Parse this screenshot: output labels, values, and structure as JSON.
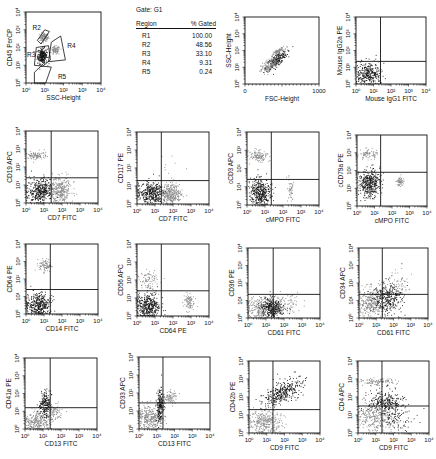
{
  "gate_table": {
    "title": "Gate: G1",
    "header": [
      "Region",
      "% Gated"
    ],
    "rows": [
      {
        "region": "R1",
        "pct": "100.00"
      },
      {
        "region": "R2",
        "pct": "48.56"
      },
      {
        "region": "R3",
        "pct": "33.10"
      },
      {
        "region": "R4",
        "pct": "9.31"
      },
      {
        "region": "R5",
        "pct": "0.24"
      }
    ]
  },
  "chart_data": [
    {
      "id": "p1",
      "type": "scatter",
      "title": "",
      "xlabel": "SSC-Height",
      "ylabel": "CD45 PerCP",
      "xscale": "log",
      "yscale": "log",
      "xlim": [
        0,
        4
      ],
      "ylim": [
        0,
        4
      ],
      "xticks": [
        "0",
        "1",
        "2",
        "3",
        "4"
      ],
      "yticks": [
        "0",
        "1",
        "2",
        "3",
        "4"
      ],
      "quadrant": null,
      "regions": [
        {
          "name": "R2",
          "label_at": [
            0.35,
            3.0
          ],
          "polygon": [
            [
              0.6,
              2.4
            ],
            [
              1.0,
              3.0
            ],
            [
              1.25,
              2.9
            ],
            [
              0.8,
              2.2
            ]
          ]
        },
        {
          "name": "R3",
          "label_at": [
            0.05,
            1.45
          ],
          "polygon": [
            [
              0.45,
              1.0
            ],
            [
              0.55,
              2.0
            ],
            [
              1.2,
              2.1
            ],
            [
              1.3,
              1.3
            ],
            [
              0.9,
              0.95
            ]
          ]
        },
        {
          "name": "R4",
          "label_at": [
            2.2,
            2.0
          ],
          "polygon": [
            [
              1.2,
              1.2
            ],
            [
              1.35,
              2.3
            ],
            [
              1.85,
              2.65
            ],
            [
              2.1,
              1.3
            ]
          ]
        },
        {
          "name": "R5",
          "label_at": [
            1.7,
            0.2
          ],
          "polygon": [
            [
              0.45,
              0.0
            ],
            [
              0.45,
              0.6
            ],
            [
              0.8,
              0.95
            ],
            [
              1.35,
              0.9
            ],
            [
              1.05,
              0.0
            ]
          ]
        }
      ],
      "populations": [
        {
          "cx": 0.95,
          "cy": 2.6,
          "sx": 0.12,
          "sy": 0.12,
          "n": 120,
          "shade": "gray"
        },
        {
          "cx": 0.85,
          "cy": 1.55,
          "sx": 0.13,
          "sy": 0.22,
          "n": 260,
          "shade": "black"
        },
        {
          "cx": 1.55,
          "cy": 1.85,
          "sx": 0.12,
          "sy": 0.12,
          "n": 90,
          "shade": "gray"
        }
      ]
    },
    {
      "id": "p2",
      "type": "scatter",
      "title": "",
      "xlabel": "FSC-Height",
      "ylabel": "SSC-Height",
      "xscale": "linear",
      "yscale": "log",
      "xlim": [
        0,
        1000
      ],
      "ylim": [
        0,
        4
      ],
      "xticks": [
        "0",
        "1000"
      ],
      "yticks": [
        "0",
        "1",
        "2",
        "3",
        "4"
      ],
      "quadrant": null,
      "populations": [
        {
          "cx": 420,
          "cy": 1.45,
          "sx": 70,
          "sy": 0.18,
          "n": 260,
          "shade": "black",
          "slope": 0.003
        },
        {
          "cx": 330,
          "cy": 1.15,
          "sx": 60,
          "sy": 0.22,
          "n": 150,
          "shade": "gray",
          "slope": 0.003
        },
        {
          "cx": 450,
          "cy": 2.0,
          "sx": 40,
          "sy": 0.07,
          "n": 70,
          "shade": "gray",
          "slope": 0.002
        }
      ]
    },
    {
      "id": "p3",
      "type": "scatter",
      "xlabel": "Mouse IgG1 FITC",
      "ylabel": "Mouse IgG2a PE",
      "xscale": "log",
      "yscale": "log",
      "xlim": [
        0,
        4
      ],
      "ylim": [
        0,
        4
      ],
      "xticks": [
        "0",
        "1",
        "2",
        "3",
        "4"
      ],
      "yticks": [
        "0",
        "1",
        "2",
        "3",
        "4"
      ],
      "quadrant": [
        1.4,
        1.35
      ],
      "populations": [
        {
          "cx": 0.7,
          "cy": 0.6,
          "sx": 0.35,
          "sy": 0.35,
          "n": 320,
          "shade": "black"
        }
      ]
    },
    {
      "id": "p4",
      "type": "scatter",
      "xlabel": "CD7 FITC",
      "ylabel": "CD19 APC",
      "xscale": "log",
      "yscale": "log",
      "xlim": [
        0,
        4
      ],
      "ylim": [
        0,
        4
      ],
      "xticks": [
        "0",
        "1",
        "2",
        "3",
        "4"
      ],
      "yticks": [
        "0",
        "1",
        "2",
        "3",
        "4"
      ],
      "quadrant": [
        1.4,
        1.4
      ],
      "populations": [
        {
          "cx": 0.75,
          "cy": 0.7,
          "sx": 0.35,
          "sy": 0.35,
          "n": 380,
          "shade": "black"
        },
        {
          "cx": 1.9,
          "cy": 0.75,
          "sx": 0.3,
          "sy": 0.35,
          "n": 300,
          "shade": "gray"
        },
        {
          "cx": 0.6,
          "cy": 2.65,
          "sx": 0.25,
          "sy": 0.13,
          "n": 100,
          "shade": "gray"
        }
      ]
    },
    {
      "id": "p5",
      "type": "scatter",
      "xlabel": "CD7 FITC",
      "ylabel": "CD117 PE",
      "xscale": "log",
      "yscale": "log",
      "xlim": [
        0,
        4
      ],
      "ylim": [
        0,
        4
      ],
      "xticks": [
        "0",
        "1",
        "2",
        "3",
        "4"
      ],
      "yticks": [
        "0",
        "1",
        "2",
        "3",
        "4"
      ],
      "quadrant": [
        1.35,
        1.3
      ],
      "populations": [
        {
          "cx": 0.75,
          "cy": 0.6,
          "sx": 0.38,
          "sy": 0.3,
          "n": 380,
          "shade": "black"
        },
        {
          "cx": 1.9,
          "cy": 0.6,
          "sx": 0.3,
          "sy": 0.3,
          "n": 300,
          "shade": "gray"
        },
        {
          "cx": 1.8,
          "cy": 2.0,
          "sx": 0.4,
          "sy": 0.3,
          "n": 8,
          "shade": "gray"
        }
      ]
    },
    {
      "id": "p6",
      "type": "scatter",
      "xlabel": "cMPO FITC",
      "ylabel": "cCD3 APC",
      "xscale": "log",
      "yscale": "log",
      "xlim": [
        0,
        4
      ],
      "ylim": [
        0,
        4
      ],
      "xticks": [
        "0",
        "1",
        "2",
        "3",
        "4"
      ],
      "yticks": [
        "0",
        "1",
        "2",
        "3",
        "4"
      ],
      "quadrant": [
        1.35,
        1.4
      ],
      "populations": [
        {
          "cx": 0.7,
          "cy": 0.7,
          "sx": 0.28,
          "sy": 0.38,
          "n": 380,
          "shade": "black"
        },
        {
          "cx": 0.6,
          "cy": 2.7,
          "sx": 0.25,
          "sy": 0.15,
          "n": 120,
          "shade": "gray"
        },
        {
          "cx": 2.4,
          "cy": 0.8,
          "sx": 0.08,
          "sy": 0.3,
          "n": 50,
          "shade": "gray"
        }
      ]
    },
    {
      "id": "p7",
      "type": "scatter",
      "xlabel": "cMPO FITC",
      "ylabel": "cCD79a PE",
      "xscale": "log",
      "yscale": "log",
      "xlim": [
        0,
        4
      ],
      "ylim": [
        0,
        4
      ],
      "xticks": [
        "0",
        "1",
        "2",
        "3",
        "4"
      ],
      "yticks": [
        "0",
        "1",
        "2",
        "3",
        "4"
      ],
      "quadrant": [
        1.35,
        1.9
      ],
      "populations": [
        {
          "cx": 0.7,
          "cy": 1.3,
          "sx": 0.3,
          "sy": 0.38,
          "n": 380,
          "shade": "black"
        },
        {
          "cx": 0.6,
          "cy": 2.95,
          "sx": 0.28,
          "sy": 0.15,
          "n": 80,
          "shade": "gray"
        },
        {
          "cx": 2.45,
          "cy": 1.4,
          "sx": 0.1,
          "sy": 0.13,
          "n": 60,
          "shade": "gray"
        }
      ]
    },
    {
      "id": "p8",
      "type": "scatter",
      "xlabel": "CD14 FITC",
      "ylabel": "CD64 PE",
      "xscale": "log",
      "yscale": "log",
      "xlim": [
        0,
        4
      ],
      "ylim": [
        0,
        4
      ],
      "xticks": [
        "0",
        "1",
        "2",
        "3",
        "4"
      ],
      "yticks": [
        "0",
        "1",
        "2",
        "3",
        "4"
      ],
      "quadrant": [
        1.35,
        1.4
      ],
      "populations": [
        {
          "cx": 0.65,
          "cy": 0.55,
          "sx": 0.33,
          "sy": 0.35,
          "n": 380,
          "shade": "black"
        },
        {
          "cx": 1.05,
          "cy": 2.8,
          "sx": 0.17,
          "sy": 0.18,
          "n": 90,
          "shade": "gray"
        }
      ]
    },
    {
      "id": "p9",
      "type": "scatter",
      "xlabel": "CD64 PE",
      "ylabel": "CD56 APC",
      "xscale": "log",
      "yscale": "log",
      "xlim": [
        0,
        4
      ],
      "ylim": [
        0,
        4
      ],
      "xticks": [
        "0",
        "1",
        "2",
        "3",
        "4"
      ],
      "yticks": [
        "0",
        "1",
        "2",
        "3",
        "4"
      ],
      "quadrant": [
        1.35,
        1.4
      ],
      "populations": [
        {
          "cx": 0.6,
          "cy": 0.6,
          "sx": 0.32,
          "sy": 0.4,
          "n": 400,
          "shade": "black"
        },
        {
          "cx": 0.6,
          "cy": 2.0,
          "sx": 0.25,
          "sy": 0.3,
          "n": 80,
          "shade": "gray"
        },
        {
          "cx": 2.85,
          "cy": 0.8,
          "sx": 0.15,
          "sy": 0.25,
          "n": 90,
          "shade": "gray"
        }
      ]
    },
    {
      "id": "p10",
      "type": "scatter",
      "xlabel": "CD61 FITC",
      "ylabel": "CD36 PE",
      "xscale": "log",
      "yscale": "log",
      "xlim": [
        0,
        4
      ],
      "ylim": [
        0,
        4
      ],
      "xticks": [
        "0",
        "1",
        "2",
        "3",
        "4"
      ],
      "yticks": [
        "0",
        "1",
        "2",
        "3",
        "4"
      ],
      "quadrant": [
        1.4,
        1.35
      ],
      "populations": [
        {
          "cx": 0.7,
          "cy": 0.5,
          "sx": 0.45,
          "sy": 0.35,
          "n": 320,
          "shade": "gray"
        },
        {
          "cx": 1.35,
          "cy": 0.6,
          "sx": 0.35,
          "sy": 0.28,
          "n": 300,
          "shade": "black"
        },
        {
          "cx": 2.2,
          "cy": 0.9,
          "sx": 0.4,
          "sy": 0.3,
          "n": 60,
          "shade": "gray"
        }
      ]
    },
    {
      "id": "p11",
      "type": "scatter",
      "xlabel": "CD61 FITC",
      "ylabel": "CD34 APC",
      "xscale": "log",
      "yscale": "log",
      "xlim": [
        0,
        4
      ],
      "ylim": [
        0,
        4
      ],
      "xticks": [
        "0",
        "1",
        "2",
        "3",
        "4"
      ],
      "yticks": [
        "0",
        "1",
        "2",
        "3",
        "4"
      ],
      "quadrant": [
        1.35,
        1.35
      ],
      "populations": [
        {
          "cx": 0.6,
          "cy": 0.9,
          "sx": 0.38,
          "sy": 0.4,
          "n": 300,
          "shade": "gray"
        },
        {
          "cx": 1.6,
          "cy": 1.2,
          "sx": 0.45,
          "sy": 0.45,
          "n": 320,
          "shade": "black"
        },
        {
          "cx": 2.2,
          "cy": 2.0,
          "sx": 0.45,
          "sy": 0.35,
          "n": 60,
          "shade": "gray"
        }
      ]
    },
    {
      "id": "p12",
      "type": "scatter",
      "xlabel": "CD13 FITC",
      "ylabel": "CD41a PE",
      "xscale": "log",
      "yscale": "log",
      "xlim": [
        0,
        4
      ],
      "ylim": [
        0,
        4
      ],
      "xticks": [
        "0",
        "1",
        "2",
        "3",
        "4"
      ],
      "yticks": [
        "0",
        "1",
        "2",
        "3",
        "4"
      ],
      "quadrant": [
        1.4,
        1.2
      ],
      "populations": [
        {
          "cx": 0.7,
          "cy": 0.45,
          "sx": 0.4,
          "sy": 0.3,
          "n": 300,
          "shade": "gray"
        },
        {
          "cx": 1.1,
          "cy": 1.4,
          "sx": 0.15,
          "sy": 0.35,
          "n": 200,
          "shade": "black"
        },
        {
          "cx": 1.6,
          "cy": 1.0,
          "sx": 0.22,
          "sy": 0.25,
          "n": 80,
          "shade": "gray"
        }
      ]
    },
    {
      "id": "p13",
      "type": "scatter",
      "xlabel": "CD13 FITC",
      "ylabel": "CD33 APC",
      "xscale": "log",
      "yscale": "log",
      "xlim": [
        0,
        4
      ],
      "ylim": [
        0,
        4
      ],
      "xticks": [
        "0",
        "1",
        "2",
        "3",
        "4"
      ],
      "yticks": [
        "0",
        "1",
        "2",
        "3",
        "4"
      ],
      "quadrant": [
        1.35,
        1.45
      ],
      "populations": [
        {
          "cx": 0.6,
          "cy": 0.6,
          "sx": 0.35,
          "sy": 0.38,
          "n": 300,
          "shade": "gray"
        },
        {
          "cx": 1.15,
          "cy": 1.3,
          "sx": 0.1,
          "sy": 0.45,
          "n": 200,
          "shade": "black"
        },
        {
          "cx": 1.75,
          "cy": 1.8,
          "sx": 0.2,
          "sy": 0.2,
          "n": 90,
          "shade": "gray"
        }
      ]
    },
    {
      "id": "p14",
      "type": "scatter",
      "xlabel": "CD9 FITC",
      "ylabel": "CD42b PE",
      "xscale": "log",
      "yscale": "log",
      "xlim": [
        0,
        4
      ],
      "ylim": [
        0,
        4
      ],
      "xticks": [
        "0",
        "1",
        "2",
        "3",
        "4"
      ],
      "yticks": [
        "0",
        "1",
        "2",
        "3",
        "4"
      ],
      "quadrant": [
        1.35,
        1.3
      ],
      "populations": [
        {
          "cx": 0.9,
          "cy": 0.6,
          "sx": 0.45,
          "sy": 0.35,
          "n": 320,
          "shade": "gray"
        },
        {
          "cx": 1.9,
          "cy": 2.3,
          "sx": 0.55,
          "sy": 0.3,
          "n": 340,
          "shade": "black",
          "slope": 0.45
        }
      ]
    },
    {
      "id": "p15",
      "type": "scatter",
      "xlabel": "CD9 FITC",
      "ylabel": "CD4 APC",
      "xscale": "log",
      "yscale": "log",
      "xlim": [
        0,
        4
      ],
      "ylim": [
        0,
        4
      ],
      "xticks": [
        "0",
        "1",
        "2",
        "3",
        "4"
      ],
      "yticks": [
        "0",
        "1",
        "2",
        "3",
        "4"
      ],
      "quadrant": [
        1.35,
        1.5
      ],
      "populations": [
        {
          "cx": 1.0,
          "cy": 0.8,
          "sx": 0.55,
          "sy": 0.45,
          "n": 320,
          "shade": "gray"
        },
        {
          "cx": 1.55,
          "cy": 1.7,
          "sx": 0.5,
          "sy": 0.35,
          "n": 260,
          "shade": "black"
        },
        {
          "cx": 1.1,
          "cy": 2.85,
          "sx": 0.45,
          "sy": 0.1,
          "n": 110,
          "shade": "gray"
        },
        {
          "cx": 2.2,
          "cy": 0.8,
          "sx": 0.45,
          "sy": 0.35,
          "n": 80,
          "shade": "black"
        }
      ]
    }
  ],
  "colors": {
    "black_population": "#151515",
    "gray_population": "#8a8a8a",
    "axis": "#111111",
    "background": "#ffffff"
  }
}
